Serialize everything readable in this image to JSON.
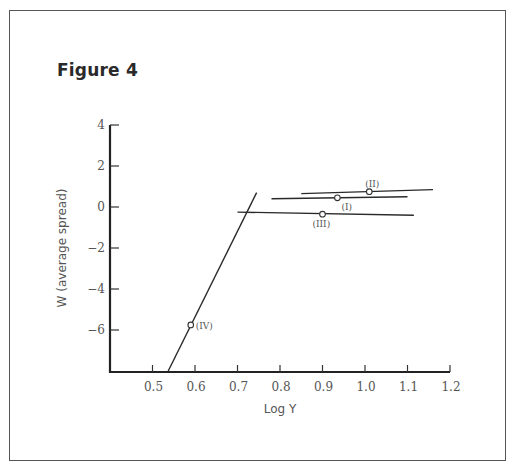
{
  "figure": {
    "title": "Figure 4"
  },
  "chart_data": {
    "type": "line",
    "title": "Figure 4",
    "xlabel": "Log Y",
    "ylabel": "W (average spread)",
    "xlim": [
      0.4,
      1.2
    ],
    "ylim": [
      -8,
      4
    ],
    "xticks": [
      0.5,
      0.6,
      0.7,
      0.8,
      0.9,
      1.0,
      1.1,
      1.2
    ],
    "xtick_labels": [
      "0.5",
      "0.6",
      "0.7",
      "0.8",
      "0.9",
      "1.0",
      "1.1",
      "1.2"
    ],
    "yticks": [
      4,
      2,
      0,
      -2,
      -4,
      -6
    ],
    "ytick_labels": [
      "4",
      "2",
      "0",
      "−2",
      "−4",
      "−6"
    ],
    "grid": false,
    "legend": null,
    "series": [
      {
        "name": "(I)",
        "line": [
          [
            0.78,
            0.4
          ],
          [
            1.1,
            0.5
          ]
        ],
        "point": [
          0.935,
          0.45
        ],
        "label_offset": [
          4,
          12
        ]
      },
      {
        "name": "(II)",
        "line": [
          [
            0.85,
            0.65
          ],
          [
            1.16,
            0.85
          ]
        ],
        "point": [
          1.01,
          0.75
        ],
        "label_offset": [
          -4,
          -5
        ]
      },
      {
        "name": "(III)",
        "line": [
          [
            0.7,
            -0.25
          ],
          [
            1.115,
            -0.4
          ]
        ],
        "point": [
          0.9,
          -0.35
        ],
        "label_offset": [
          -10,
          13
        ]
      },
      {
        "name": "(IV)",
        "line": [
          [
            0.537,
            -8
          ],
          [
            0.745,
            0.7
          ]
        ],
        "point": [
          0.59,
          -5.75
        ],
        "label_offset": [
          5,
          4
        ]
      }
    ]
  }
}
